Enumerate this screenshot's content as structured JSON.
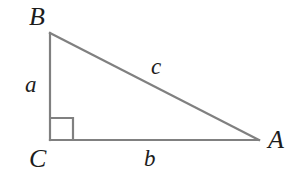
{
  "figure": {
    "kind": "right-triangle-diagram",
    "background_color": "#ffffff",
    "stroke_color": "#808080",
    "text_color": "#1c1c1c",
    "stroke_width": 2.2,
    "vertices": {
      "B": {
        "label": "B",
        "x": 50,
        "y": 33
      },
      "C": {
        "label": "C",
        "x": 50,
        "y": 140
      },
      "A": {
        "label": "A",
        "x": 259,
        "y": 140
      }
    },
    "sides": {
      "a": {
        "label": "a",
        "from": "B",
        "to": "C",
        "description": "vertical leg"
      },
      "b": {
        "label": "b",
        "from": "C",
        "to": "A",
        "description": "horizontal leg"
      },
      "c": {
        "label": "c",
        "from": "B",
        "to": "A",
        "description": "hypotenuse"
      }
    },
    "right_angle_marker": {
      "at_vertex": "C",
      "size": 23,
      "x": 50,
      "y": 118,
      "width": 23,
      "height": 22
    }
  }
}
